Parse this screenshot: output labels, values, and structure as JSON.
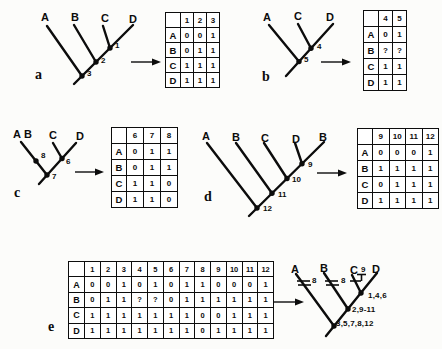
{
  "colors": {
    "ink": "#0c0c0c",
    "paper": "#fcfcfa"
  },
  "figure": {
    "panels": [
      {
        "id": "a",
        "letter": "a",
        "tree": {
          "tips": [
            "A",
            "B",
            "C",
            "D"
          ],
          "node_labels": [
            "1",
            "2",
            "3"
          ]
        },
        "matrix": {
          "col_headers": [
            "1",
            "2",
            "3"
          ],
          "rows": [
            {
              "label": "A",
              "values": [
                "0",
                "0",
                "1"
              ]
            },
            {
              "label": "B",
              "values": [
                "0",
                "1",
                "1"
              ]
            },
            {
              "label": "C",
              "values": [
                "1",
                "1",
                "1"
              ]
            },
            {
              "label": "D",
              "values": [
                "1",
                "1",
                "1"
              ]
            }
          ]
        }
      },
      {
        "id": "b",
        "letter": "b",
        "tree": {
          "tips": [
            "A",
            "C",
            "D"
          ],
          "node_labels": [
            "4",
            "5"
          ]
        },
        "matrix": {
          "col_headers": [
            "4",
            "5"
          ],
          "rows": [
            {
              "label": "A",
              "values": [
                "0",
                "1"
              ]
            },
            {
              "label": "B",
              "values": [
                "?",
                "?"
              ]
            },
            {
              "label": "C",
              "values": [
                "1",
                "1"
              ]
            },
            {
              "label": "D",
              "values": [
                "1",
                "1"
              ]
            }
          ]
        }
      },
      {
        "id": "c",
        "letter": "c",
        "tree": {
          "tips": [
            "A",
            "B",
            "C",
            "D"
          ],
          "node_labels": [
            "8",
            "6",
            "7"
          ]
        },
        "matrix": {
          "col_headers": [
            "6",
            "7",
            "8"
          ],
          "rows": [
            {
              "label": "A",
              "values": [
                "0",
                "1",
                "1"
              ]
            },
            {
              "label": "B",
              "values": [
                "0",
                "1",
                "1"
              ]
            },
            {
              "label": "C",
              "values": [
                "1",
                "1",
                "0"
              ]
            },
            {
              "label": "D",
              "values": [
                "1",
                "1",
                "0"
              ]
            }
          ]
        }
      },
      {
        "id": "d",
        "letter": "d",
        "tree": {
          "tips": [
            "A",
            "B",
            "C",
            "D",
            "B"
          ],
          "node_labels": [
            "9",
            "10",
            "11",
            "12"
          ]
        },
        "matrix": {
          "col_headers": [
            "9",
            "10",
            "11",
            "12"
          ],
          "rows": [
            {
              "label": "A",
              "values": [
                "0",
                "0",
                "0",
                "1"
              ]
            },
            {
              "label": "B",
              "values": [
                "1",
                "1",
                "1",
                "1"
              ]
            },
            {
              "label": "C",
              "values": [
                "0",
                "1",
                "1",
                "1"
              ]
            },
            {
              "label": "D",
              "values": [
                "1",
                "1",
                "1",
                "1"
              ]
            }
          ]
        }
      },
      {
        "id": "e",
        "letter": "e",
        "matrix": {
          "col_headers": [
            "1",
            "2",
            "3",
            "4",
            "5",
            "6",
            "7",
            "8",
            "9",
            "10",
            "11",
            "12"
          ],
          "rows": [
            {
              "label": "A",
              "values": [
                "0",
                "0",
                "1",
                "0",
                "1",
                "0",
                "1",
                "1",
                "0",
                "0",
                "0",
                "1"
              ]
            },
            {
              "label": "B",
              "values": [
                "0",
                "1",
                "1",
                "?",
                "?",
                "0",
                "1",
                "1",
                "1",
                "1",
                "1",
                "1"
              ]
            },
            {
              "label": "C",
              "values": [
                "1",
                "1",
                "1",
                "1",
                "1",
                "1",
                "1",
                "0",
                "0",
                "1",
                "1",
                "1"
              ]
            },
            {
              "label": "D",
              "values": [
                "1",
                "1",
                "1",
                "1",
                "1",
                "1",
                "1",
                "0",
                "1",
                "1",
                "1",
                "1"
              ]
            }
          ]
        },
        "tree": {
          "tips": [
            "A",
            "B",
            "C",
            "D"
          ],
          "branch_marks": [
            {
              "branch": "A",
              "label": "8"
            },
            {
              "branch": "B",
              "label": "8"
            },
            {
              "branch": "C",
              "label": "9"
            }
          ],
          "node_labels": [
            "1,4,6",
            "2,9-11",
            "3,5,7,8,12"
          ]
        }
      }
    ]
  }
}
